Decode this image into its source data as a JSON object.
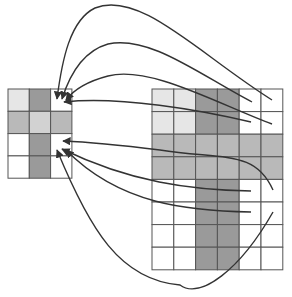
{
  "diagram": {
    "type": "grid-mapping",
    "colors": {
      "white": "#ffffff",
      "very_light": "#e6e6e6",
      "light": "#d2d2d2",
      "medium": "#b9b9b9",
      "dark": "#9a9a9a",
      "grid_line": "#555555",
      "arrow": "#333333"
    },
    "small_grid": {
      "x": 8,
      "y": 89,
      "cols": 3,
      "rows": 4,
      "cell_w": 21.3,
      "cell_h": 22.3,
      "cells": [
        [
          "very_light",
          "dark",
          "white"
        ],
        [
          "medium",
          "light",
          "medium"
        ],
        [
          "white",
          "dark",
          "white"
        ],
        [
          "white",
          "dark",
          "white"
        ]
      ]
    },
    "large_grid": {
      "x": 152,
      "y": 89,
      "cols": 6,
      "rows": 8,
      "cell_w": 21.8,
      "cell_h": 22.6,
      "cells": [
        [
          "very_light",
          "very_light",
          "dark",
          "dark",
          "white",
          "white"
        ],
        [
          "very_light",
          "very_light",
          "dark",
          "dark",
          "white",
          "white"
        ],
        [
          "medium",
          "medium",
          "medium",
          "medium",
          "medium",
          "medium"
        ],
        [
          "medium",
          "medium",
          "medium",
          "medium",
          "medium",
          "medium"
        ],
        [
          "white",
          "white",
          "dark",
          "dark",
          "white",
          "white"
        ],
        [
          "white",
          "white",
          "dark",
          "dark",
          "white",
          "white"
        ],
        [
          "white",
          "white",
          "dark",
          "dark",
          "white",
          "white"
        ],
        [
          "white",
          "white",
          "dark",
          "dark",
          "white",
          "white"
        ]
      ]
    },
    "arrows": [
      {
        "name": "arrow-top-1",
        "d": "M272,100 C200,55 140,-10 95,8 C70,20 62,60 57,99"
      },
      {
        "name": "arrow-top-2",
        "d": "M252,102 C200,75 150,35 108,44 C80,52 68,80 62,99"
      },
      {
        "name": "arrow-top-3",
        "d": "M272,124 C220,105 150,65 108,76 C85,82 72,92 66,100"
      },
      {
        "name": "arrow-mid-1",
        "d": "M251,122 C200,110 120,96 64,102"
      },
      {
        "name": "arrow-low-1",
        "d": "M273,190 C255,150 225,160 160,150 C120,145 90,142 63,141"
      },
      {
        "name": "arrow-low-2",
        "d": "M251,191 C190,190 130,182 62,149"
      },
      {
        "name": "arrow-low-3",
        "d": "M251,212 C190,211 120,205 66,150"
      },
      {
        "name": "arrow-low-4",
        "d": "M273,212 C240,270 200,300 180,285 C120,280 90,230 57,150"
      }
    ]
  }
}
